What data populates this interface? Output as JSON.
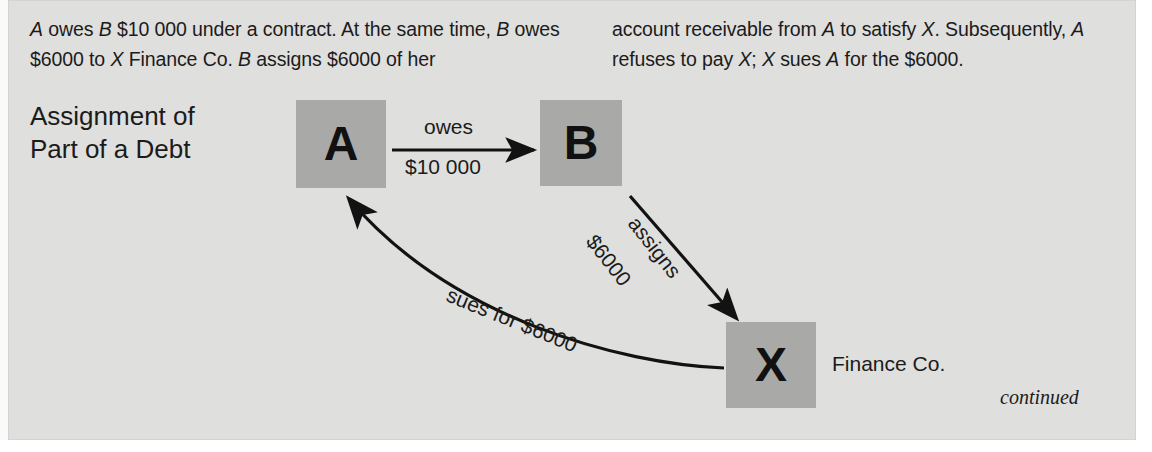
{
  "panel": {
    "background_color": "#dfdfdd",
    "box_color": "#a9a9a7",
    "text_color": "#1b1b1b"
  },
  "intro": {
    "left_column": "A owes B $10 000 under a contract. At the same time, B owes $6000 to X Finance Co. B assigns $6000 of her",
    "right_column": "account receivable from A to satisfy X. Subsequently, A refuses to pay X; X sues A for the $6000."
  },
  "figure": {
    "title": "Assignment of Part of a Debt",
    "title_line1": "Assignment of",
    "title_line2": "Part of a Debt",
    "continued_note": "continued"
  },
  "nodes": [
    {
      "id": "a",
      "label": "A",
      "caption": ""
    },
    {
      "id": "b",
      "label": "B",
      "caption": ""
    },
    {
      "id": "x",
      "label": "X",
      "caption": "Finance Co."
    }
  ],
  "node_labels": {
    "a": "A",
    "b": "B",
    "x": "X",
    "x_caption": "Finance Co."
  },
  "edges": {
    "owes": {
      "from": "A",
      "to": "B",
      "line1": "owes",
      "line2": "$10 000",
      "style": "straight"
    },
    "assigns": {
      "from": "B",
      "to": "X",
      "line1": "assigns",
      "line2": "$6000",
      "style": "diagonal"
    },
    "sues": {
      "from": "X",
      "to": "A",
      "label": "sues for $6000",
      "style": "curved"
    }
  }
}
